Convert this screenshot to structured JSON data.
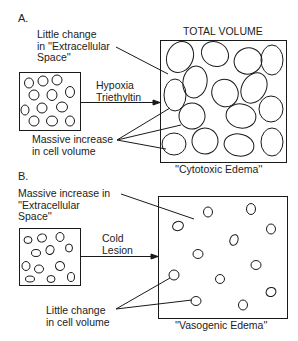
{
  "panel_a": {
    "section_label": "A.",
    "top_label": "TOTAL VOLUME",
    "ecs_label": "Little change\nin ''Extracellular\nSpace''",
    "cause_label": "Hypoxia\nTriethyltin",
    "cell_label": "Massive increase\nin cell volume",
    "caption": "''Cytotoxic Edema''"
  },
  "panel_b": {
    "section_label": "B.",
    "ecs_label": "Massive increase in\n''Extracellular\nSpace''",
    "cause_label": "Cold\nLesion",
    "cell_label": "Little change\nin cell volume",
    "caption": "''Vasogenic Edema''"
  },
  "colors": {
    "line": "#1a1a1a",
    "background": "#ffffff"
  }
}
